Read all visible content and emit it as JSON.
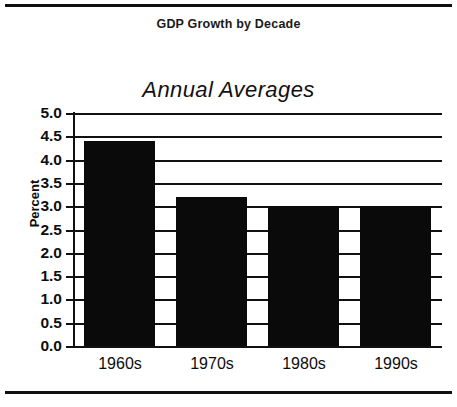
{
  "document": {
    "heading": "GDP Growth by Decade"
  },
  "chart_data": {
    "type": "bar",
    "title": "Annual Averages",
    "xlabel": "",
    "ylabel": "Percent",
    "categories": [
      "1960s",
      "1970s",
      "1980s",
      "1990s"
    ],
    "values": [
      4.4,
      3.2,
      3.0,
      3.0
    ],
    "ylim": [
      0.0,
      5.0
    ],
    "ytick_labels": [
      "5.0",
      "4.5",
      "4.0",
      "3.5",
      "3.0",
      "2.5",
      "2.0",
      "1.5",
      "1.0",
      "0.5",
      "0.0"
    ],
    "ytick_values": [
      5.0,
      4.5,
      4.0,
      3.5,
      3.0,
      2.5,
      2.0,
      1.5,
      1.0,
      0.5,
      0.0
    ],
    "grid": true,
    "legend": "none",
    "bar_color": "#0a0a0a",
    "axis_color": "#111111"
  }
}
